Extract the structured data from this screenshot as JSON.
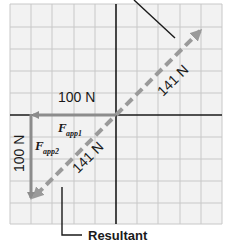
{
  "diagram": {
    "type": "vector-addition",
    "grid": {
      "cols": 10,
      "rows": 10,
      "cell_px": 21.2,
      "color": "#c8c8c8",
      "background": "#f2f2f2"
    },
    "axes_color": "#1a1a1a",
    "vectors": [
      {
        "id": "fapp1",
        "label_main": "F",
        "label_sub": "app1",
        "magnitude": "100 N",
        "direction": "left",
        "color": "#8c8c8c",
        "style": "solid"
      },
      {
        "id": "fapp2",
        "label_main": "F",
        "label_sub": "app2",
        "magnitude": "100 N",
        "direction": "down",
        "color": "#8c8c8c",
        "style": "solid"
      },
      {
        "id": "resultant",
        "magnitude": "141 N",
        "direction": "down-left",
        "color": "#9a9a9a",
        "style": "dashed"
      },
      {
        "id": "equilibrant",
        "magnitude": "141 N",
        "direction": "up-right",
        "color": "#9a9a9a",
        "style": "dashed"
      }
    ],
    "labels": {
      "fapp1_mag": "100 N",
      "fapp2_mag": "100 N",
      "resultant_mag": "141 N",
      "equilibrant_mag": "141 N",
      "fapp1_main": "F",
      "fapp1_sub": "app1",
      "fapp2_main": "F",
      "fapp2_sub": "app2",
      "callout": "Resultant"
    }
  }
}
